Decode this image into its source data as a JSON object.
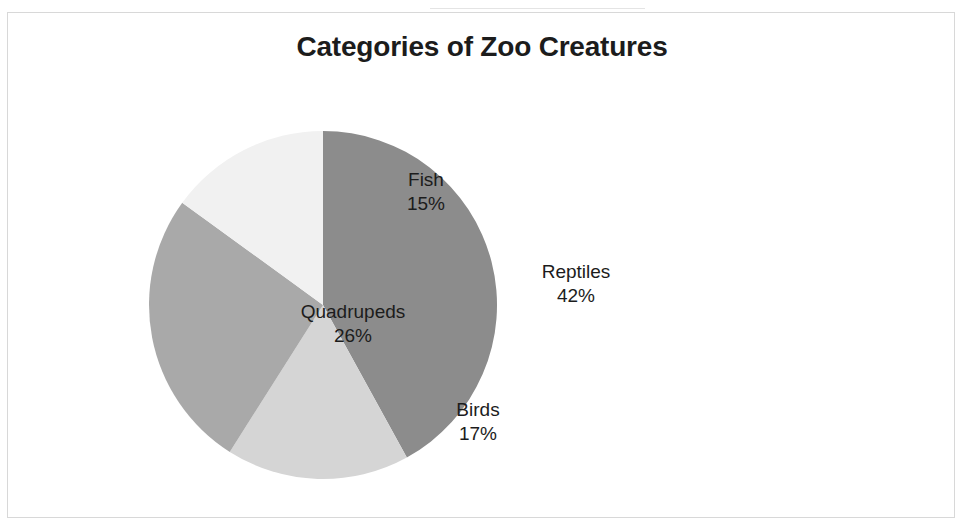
{
  "chart_data": {
    "type": "pie",
    "title": "Categories of Zoo Creatures",
    "subtitle": "",
    "xlabel": "",
    "ylabel": "",
    "legend": "none",
    "grid": false,
    "value_unit": "%",
    "start_angle_deg": 0,
    "direction": "clockwise",
    "categories": [
      "Reptiles",
      "Birds",
      "Quadrupeds",
      "Fish"
    ],
    "values": [
      42,
      17,
      26,
      15
    ],
    "slices": [
      {
        "label": "Reptiles",
        "value": 42,
        "value_text": "42%",
        "color": "#8c8c8c",
        "label_color": "#1c1c1c"
      },
      {
        "label": "Birds",
        "value": 17,
        "value_text": "17%",
        "color": "#d5d5d5",
        "label_color": "#1c1c1c"
      },
      {
        "label": "Quadrupeds",
        "value": 26,
        "value_text": "26%",
        "color": "#a9a9a9",
        "label_color": "#1c1c1c"
      },
      {
        "label": "Fish",
        "value": 15,
        "value_text": "15%",
        "color": "#f1f1f1",
        "label_color": "#1c1c1c"
      }
    ]
  },
  "chart": {
    "title": "Categories of Zoo Creatures",
    "border_color": "#d8d8d8",
    "background": "#ffffff"
  },
  "labels": {
    "reptiles": {
      "name": "Reptiles",
      "value": "42%"
    },
    "birds": {
      "name": "Birds",
      "value": "17%"
    },
    "quadrupeds": {
      "name": "Quadrupeds",
      "value": "26%"
    },
    "fish": {
      "name": "Fish",
      "value": "15%"
    }
  }
}
